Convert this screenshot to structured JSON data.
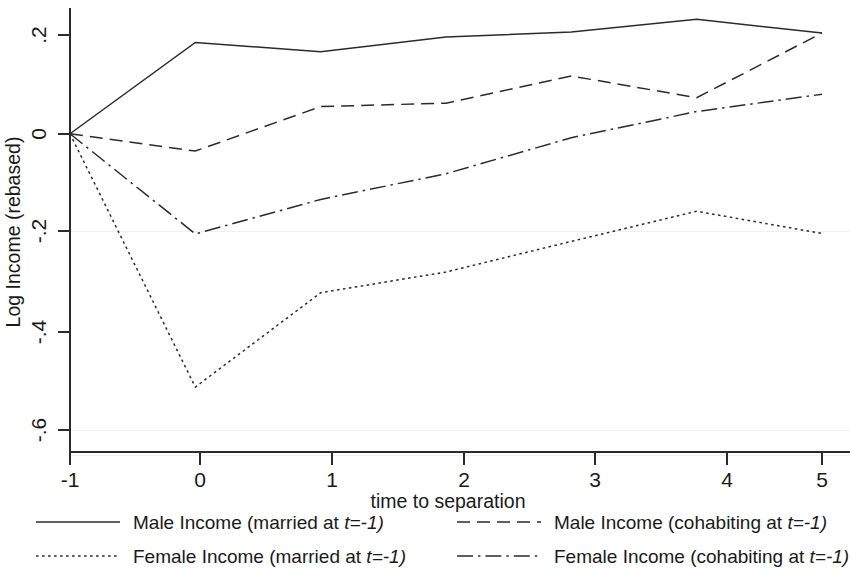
{
  "chart_data": {
    "type": "line",
    "title": "",
    "xlabel": "time to separation",
    "ylabel": "Log Income (rebased)",
    "x": [
      -1,
      0,
      1,
      2,
      3,
      4,
      5
    ],
    "xticks": [
      "-1",
      "0",
      "1",
      "2",
      "3",
      "4",
      "5"
    ],
    "yticks": [
      ".2",
      "0",
      "-.2",
      "-.4",
      "-.6"
    ],
    "ytick_values": [
      0.2,
      0,
      -0.2,
      -0.4,
      -0.6
    ],
    "xlim": [
      -1,
      5
    ],
    "ylim": [
      -0.68,
      0.27
    ],
    "grid": false,
    "legend_position": "below",
    "series": [
      {
        "name": "Male Income (married at t=-1)",
        "style": "solid",
        "values": [
          0,
          0.185,
          0.166,
          0.196,
          0.206,
          0.232,
          0.204
        ]
      },
      {
        "name": "Female Income (married at t=-1)",
        "style": "dotted",
        "values": [
          0,
          -0.513,
          -0.322,
          -0.28,
          -0.218,
          -0.157,
          -0.202
        ]
      },
      {
        "name": "Male Income (cohabiting at t=-1)",
        "style": "dashed",
        "values": [
          0,
          -0.035,
          0.055,
          0.062,
          0.117,
          0.073,
          0.204
        ]
      },
      {
        "name": "Female Income (cohabiting at t=-1)",
        "style": "dashdot",
        "values": [
          0,
          -0.203,
          -0.133,
          -0.081,
          -0.008,
          0.045,
          0.08
        ]
      }
    ]
  },
  "legend": {
    "entries": [
      {
        "label_prefix": "Male Income (married at ",
        "label_ital": "t",
        "label_suffix": "=-1)",
        "style": "solid"
      },
      {
        "label_prefix": "Male Income (cohabiting at ",
        "label_ital": "t",
        "label_suffix": "=-1)",
        "style": "dashed"
      },
      {
        "label_prefix": "Female Income (married at ",
        "label_ital": "t",
        "label_suffix": "=-1)",
        "style": "dotted"
      },
      {
        "label_prefix": "Female Income (cohabiting at ",
        "label_ital": "t",
        "label_suffix": "=-1)",
        "style": "dashdot"
      }
    ]
  },
  "axes": {
    "x_title": "time to separation",
    "y_title": "Log Income (rebased)"
  }
}
